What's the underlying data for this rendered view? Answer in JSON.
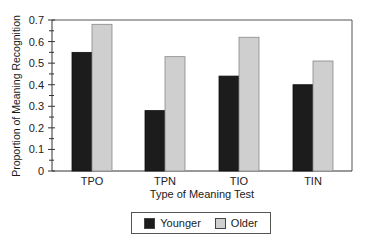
{
  "chart_data": {
    "type": "bar",
    "title": "",
    "xlabel": "Type of Meaning Test",
    "ylabel": "Proportion of Meaning Recognition",
    "categories": [
      "TPO",
      "TPN",
      "TIO",
      "TIN"
    ],
    "series": [
      {
        "name": "Younger",
        "color": "#1c1c1c",
        "values": [
          0.55,
          0.28,
          0.44,
          0.4
        ]
      },
      {
        "name": "Older",
        "color": "#cfcfcf",
        "values": [
          0.68,
          0.53,
          0.62,
          0.51
        ]
      }
    ],
    "ylim": [
      0,
      0.7
    ],
    "yticks": [
      "0",
      "0.1",
      "0.2",
      "0.3",
      "0.4",
      "0.5",
      "0.6",
      "0.7"
    ],
    "grid": false,
    "legend_position": "bottom"
  },
  "legend": {
    "younger_label": "Younger",
    "older_label": "Older"
  }
}
